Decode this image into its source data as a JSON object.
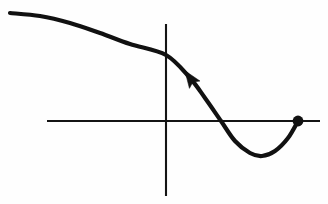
{
  "figure": {
    "background_color": "#fefefe",
    "ink_color": "#111111",
    "width": 328,
    "height": 204
  },
  "chart_data": {
    "type": "line",
    "xlabel": "",
    "ylabel": "",
    "grid": false,
    "legend": null,
    "axes": {
      "origin": [
        166,
        121
      ],
      "x_axis": {
        "name": "horizontal-axis",
        "x_start": 47,
        "x_end": 320,
        "y": 121
      },
      "y_axis": {
        "name": "vertical-axis",
        "x": 166,
        "y_start": 24,
        "y_end": 196
      }
    },
    "series": [
      {
        "name": "curve",
        "description": "Smooth decreasing curve that flattens at upper left, crosses the vertical axis, descends steeply through the horizontal axis, reaches a local minimum below it, then rises back to the horizontal axis at a filled endpoint.",
        "points": [
          [
            10,
            13
          ],
          [
            40,
            16
          ],
          [
            70,
            23
          ],
          [
            100,
            33
          ],
          [
            130,
            44
          ],
          [
            166,
            55
          ],
          [
            190,
            78
          ],
          [
            205,
            98
          ],
          [
            221,
            121
          ],
          [
            235,
            141
          ],
          [
            250,
            153
          ],
          [
            262,
            156
          ],
          [
            275,
            151
          ],
          [
            288,
            138
          ],
          [
            298,
            121
          ]
        ],
        "x_axis_crossing": [
          221,
          121
        ],
        "y_axis_crossing": [
          166,
          55
        ],
        "local_minimum": [
          262,
          156
        ],
        "stroke_width": 4.2
      }
    ],
    "annotations": [
      {
        "name": "direction-arrow",
        "type": "arrowhead",
        "position": [
          190,
          78
        ],
        "points_toward": "upper-left",
        "angle_degrees": 235,
        "meaning": "direction of travel along the curve"
      },
      {
        "name": "endpoint-dot",
        "type": "filled-circle",
        "position": [
          298,
          121
        ],
        "radius": 5.4,
        "meaning": "closed endpoint of the curve located on the horizontal axis"
      }
    ]
  }
}
